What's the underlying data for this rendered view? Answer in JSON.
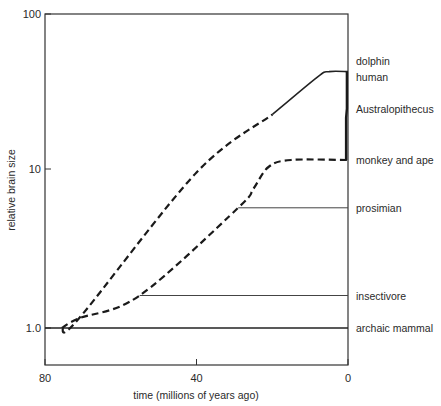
{
  "chart_data": {
    "type": "line",
    "title": "",
    "xlabel": "time (millions of years ago)",
    "ylabel": "relative brain size",
    "x_axis": {
      "range": [
        80,
        0
      ],
      "ticks": [
        80,
        40,
        0
      ],
      "tick_labels": [
        "80",
        "40",
        "0"
      ],
      "reversed": true
    },
    "y_axis": {
      "scale": "log",
      "range": [
        0.8,
        100
      ],
      "ticks": [
        1,
        10,
        100
      ],
      "tick_labels": [
        "1.0",
        "10",
        "100"
      ]
    },
    "grid": false,
    "legend": "direct labels at right",
    "series": [
      {
        "name": "archaic mammal",
        "style": "solid",
        "points": [
          [
            80,
            1.0
          ],
          [
            0,
            1.0
          ]
        ]
      },
      {
        "name": "insectivore",
        "style": "solid-thin",
        "points": [
          [
            55,
            1.6
          ],
          [
            0,
            1.6
          ]
        ]
      },
      {
        "name": "prosimian",
        "style": "solid-thin",
        "points": [
          [
            29,
            5.7
          ],
          [
            0,
            5.7
          ]
        ]
      },
      {
        "name": "primate lineage (to monkey and ape)",
        "style": "dashed",
        "points": [
          [
            75.5,
            1.0
          ],
          [
            71,
            1.15
          ],
          [
            55,
            1.6
          ],
          [
            29,
            5.7
          ],
          [
            25,
            7.5
          ],
          [
            21,
            10.3
          ],
          [
            15,
            11.4
          ],
          [
            0,
            11.4
          ]
        ]
      },
      {
        "name": "upper lineage (to dolphin)",
        "style": "dashed-then-solid",
        "points": [
          [
            75.5,
            1.0
          ],
          [
            71,
            1.15
          ],
          [
            40,
            9.5
          ],
          [
            20,
            22
          ],
          [
            8,
            38
          ],
          [
            5,
            41
          ],
          [
            0,
            41
          ]
        ]
      },
      {
        "name": "human (via Australopithecus)",
        "style": "solid-thick",
        "points": [
          [
            0.5,
            11.4
          ],
          [
            0.5,
            21
          ],
          [
            0.3,
            24
          ],
          [
            0.3,
            41
          ]
        ]
      }
    ],
    "right_labels": [
      {
        "text": "dolphin",
        "y": 48
      },
      {
        "text": "human",
        "y": 38
      },
      {
        "text": "Australopithecus",
        "y": 24
      },
      {
        "text": "monkey and ape",
        "y": 11.4
      },
      {
        "text": "prosimian",
        "y": 5.7
      },
      {
        "text": "insectivore",
        "y": 1.6
      },
      {
        "text": "archaic mammal",
        "y": 1.0
      }
    ]
  }
}
